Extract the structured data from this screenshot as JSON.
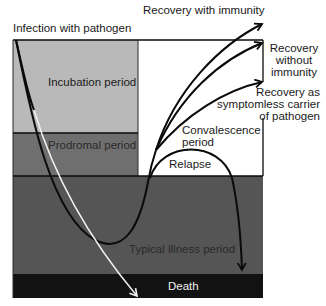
{
  "colors": {
    "incubation": "#b9b9b9",
    "prodromal": "#6f6f6f",
    "typical_illness": "#555555",
    "death": "#121212",
    "white_region": "#ffffff",
    "line": "#0a0a0a"
  },
  "labels": {
    "infection": "Infection with pathogen",
    "incubation": "Incubation period",
    "prodromal": "Prodromal period",
    "typical_illness": "Typical illness period",
    "death": "Death",
    "convalescence_line1": "Convalescence",
    "convalescence_line2": "period",
    "relapse": "Relapse",
    "recovery_immunity": "Recovery with immunity",
    "recovery_without_line1": "Recovery",
    "recovery_without_line2": "without",
    "recovery_without_line3": "immunity",
    "recovery_carrier_line1": "Recovery as",
    "recovery_carrier_line2": "symptomless carrier",
    "recovery_carrier_line3": "of pathogen"
  }
}
